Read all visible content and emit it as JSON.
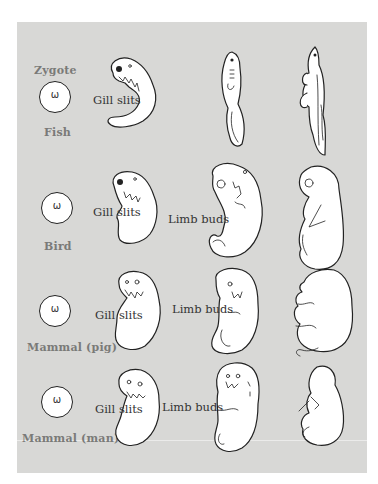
{
  "figure": {
    "header_label": "Zygote",
    "rows": [
      {
        "organism": "Fish",
        "zygote_glyph": "ω",
        "stage1_label": "Gill slits",
        "stage2_label": ""
      },
      {
        "organism": "Bird",
        "zygote_glyph": "ω",
        "stage1_label": "Gill slits",
        "stage2_label": "Limb buds"
      },
      {
        "organism": "Mammal (pig)",
        "zygote_glyph": "ω",
        "stage1_label": "Gill slits",
        "stage2_label": "Limb buds"
      },
      {
        "organism": "Mammal (man)",
        "zygote_glyph": "ω",
        "stage1_label": "Gill slits",
        "stage2_label": "Limb buds"
      }
    ],
    "columns": [
      "Zygote",
      "Early embryo",
      "Middle stage",
      "Late stage"
    ],
    "colors": {
      "panel": "#d8d8d6",
      "label_gray": "#7a7a78",
      "ink": "#222222"
    }
  }
}
